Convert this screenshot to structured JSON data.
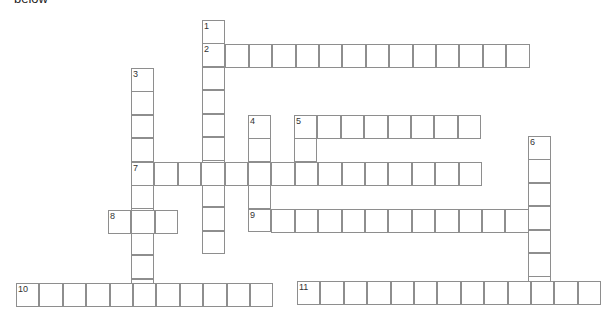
{
  "header": {
    "cutoff_text": "below"
  },
  "puzzle": {
    "cell_size": 23.4,
    "words": [
      {
        "number": "1",
        "direction": "down",
        "x": 202,
        "y": 20,
        "length": 10
      },
      {
        "number": "2",
        "direction": "across",
        "x": 202,
        "y": 44,
        "length": 14
      },
      {
        "number": "3",
        "direction": "down",
        "x": 131,
        "y": 68,
        "length": 10
      },
      {
        "number": "4",
        "direction": "down",
        "x": 248,
        "y": 115,
        "length": 5
      },
      {
        "number": "5",
        "direction": "across",
        "x": 294,
        "y": 115,
        "length": 8
      },
      {
        "number": "5d",
        "direction": "down",
        "x": 294,
        "y": 115,
        "length": 3,
        "label": ""
      },
      {
        "number": "6",
        "direction": "down",
        "x": 528,
        "y": 136,
        "length": 7
      },
      {
        "number": "7",
        "direction": "across",
        "x": 131,
        "y": 162,
        "length": 15
      },
      {
        "number": "8",
        "direction": "across",
        "x": 108,
        "y": 210,
        "length": 3
      },
      {
        "number": "9",
        "direction": "across",
        "x": 248,
        "y": 209,
        "length": 13
      },
      {
        "number": "10",
        "direction": "across",
        "x": 16,
        "y": 283,
        "length": 11
      },
      {
        "number": "11",
        "direction": "across",
        "x": 297,
        "y": 281,
        "length": 13
      }
    ]
  }
}
